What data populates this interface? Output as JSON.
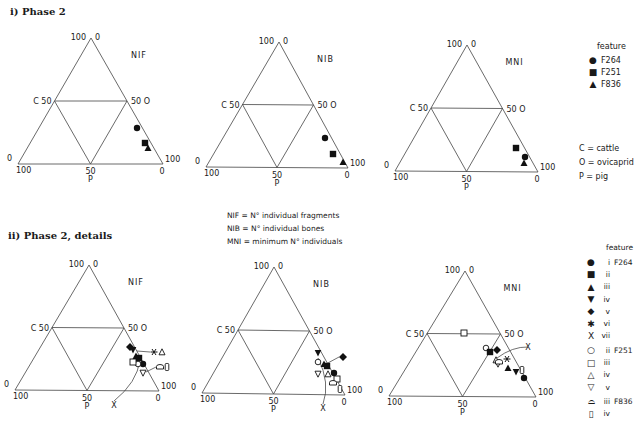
{
  "headings": {
    "phase2": "i) Phase  2",
    "phase2_details": "ii) Phase  2,  details"
  },
  "definitions": [
    "NIF  =  N° individual fragments",
    "NIB  =  N° individual bones",
    "MNI  =  minimum N° individuals"
  ],
  "abbreviations": [
    "C = cattle",
    "O = ovicaprid",
    "P = pig"
  ],
  "legend_phase2": {
    "title": "feature",
    "items": [
      {
        "symbol": "filled-circle",
        "label": "F264"
      },
      {
        "symbol": "filled-square",
        "label": "F251"
      },
      {
        "symbol": "filled-triangle",
        "label": "F836"
      }
    ]
  },
  "legend_details": {
    "title": "feature",
    "items": [
      {
        "symbol": "filled-circle",
        "code": "i",
        "feature": "F264"
      },
      {
        "symbol": "filled-square",
        "code": "ii",
        "feature": ""
      },
      {
        "symbol": "filled-triangle",
        "code": "iii",
        "feature": ""
      },
      {
        "symbol": "filled-inverted-triangle",
        "code": "iv",
        "feature": ""
      },
      {
        "symbol": "filled-diamond",
        "code": "v",
        "feature": ""
      },
      {
        "symbol": "asterisk",
        "code": "vi",
        "feature": ""
      },
      {
        "symbol": "x",
        "code": "vii",
        "feature": ""
      },
      {
        "symbol": "open-circle",
        "code": "ii",
        "feature": "F251"
      },
      {
        "symbol": "open-square",
        "code": "iii",
        "feature": ""
      },
      {
        "symbol": "open-triangle",
        "code": "iv",
        "feature": ""
      },
      {
        "symbol": "open-inverted-triangle",
        "code": "v",
        "feature": ""
      },
      {
        "symbol": "open-dome",
        "code": "iii",
        "feature": "F836"
      },
      {
        "symbol": "open-tall-rect",
        "code": "iv",
        "feature": ""
      }
    ]
  },
  "axis_labels": {
    "apex_left": "100",
    "apex_right": "0",
    "mid_left": "C 50",
    "mid_right": "50 O",
    "bl_top": "0",
    "bl_bottom": "100",
    "br_top": "100",
    "br_bottom": "0",
    "bottom_mid": "50",
    "bottom_axis": "P"
  },
  "chart_data": [
    {
      "type": "scatter",
      "subtype": "ternary",
      "title": "NIF",
      "panel": "i) Phase 2",
      "axes": {
        "C": "cattle",
        "O": "ovicaprid",
        "P": "pig"
      },
      "ticks": [
        0,
        50,
        100
      ],
      "geometry": {
        "apex": [
          91,
          38
        ],
        "left": [
          18,
          164
        ],
        "right": [
          163,
          164
        ]
      },
      "points": [
        {
          "feature": "F264",
          "symbol": "filled-circle",
          "x": 137,
          "y": 128
        },
        {
          "feature": "F251",
          "symbol": "filled-square",
          "x": 145,
          "y": 143
        },
        {
          "feature": "F836",
          "symbol": "filled-triangle",
          "x": 148,
          "y": 148
        }
      ]
    },
    {
      "type": "scatter",
      "subtype": "ternary",
      "title": "NIB",
      "panel": "i) Phase 2",
      "axes": {
        "C": "cattle",
        "O": "ovicaprid",
        "P": "pig"
      },
      "ticks": [
        0,
        50,
        100
      ],
      "geometry": {
        "apex": [
          279,
          42
        ],
        "left": [
          206,
          167
        ],
        "right": [
          348,
          168
        ]
      },
      "points": [
        {
          "feature": "F264",
          "symbol": "filled-circle",
          "x": 325,
          "y": 138
        },
        {
          "feature": "F251",
          "symbol": "filled-square",
          "x": 333,
          "y": 154
        },
        {
          "feature": "F836",
          "symbol": "filled-triangle",
          "x": 343,
          "y": 162
        }
      ]
    },
    {
      "type": "scatter",
      "subtype": "ternary",
      "title": "MNI",
      "panel": "i) Phase 2",
      "axes": {
        "C": "cattle",
        "O": "ovicaprid",
        "P": "pig"
      },
      "ticks": [
        0,
        50,
        100
      ],
      "geometry": {
        "apex": [
          467,
          45
        ],
        "left": [
          395,
          171
        ],
        "right": [
          538,
          172
        ]
      },
      "points": [
        {
          "feature": "F264",
          "symbol": "filled-circle",
          "x": 525,
          "y": 157
        },
        {
          "feature": "F251",
          "symbol": "filled-square",
          "x": 516,
          "y": 148
        },
        {
          "feature": "F836",
          "symbol": "filled-triangle",
          "x": 524,
          "y": 163
        }
      ]
    },
    {
      "type": "scatter",
      "subtype": "ternary",
      "title": "NIF",
      "panel": "ii) Phase 2, details",
      "axes": {
        "C": "cattle",
        "O": "ovicaprid",
        "P": "pig"
      },
      "ticks": [
        0,
        50,
        100
      ],
      "geometry": {
        "apex": [
          89,
          265
        ],
        "left": [
          15,
          390
        ],
        "right": [
          159,
          391
        ]
      },
      "points": [
        {
          "feature": "F264 v",
          "symbol": "filled-diamond",
          "x": 130,
          "y": 347
        },
        {
          "feature": "F264 iv",
          "symbol": "filled-inverted-triangle",
          "x": 133,
          "y": 350
        },
        {
          "feature": "F264 ii",
          "symbol": "filled-square",
          "x": 139,
          "y": 358
        },
        {
          "feature": "F264 iii",
          "symbol": "filled-triangle",
          "x": 136,
          "y": 356
        },
        {
          "feature": "F264 i",
          "symbol": "filled-circle",
          "x": 143,
          "y": 364
        },
        {
          "feature": "F251 ii",
          "symbol": "open-circle",
          "x": 138,
          "y": 364
        },
        {
          "feature": "F251 iii",
          "symbol": "open-square",
          "x": 133,
          "y": 362
        },
        {
          "feature": "F251 v",
          "symbol": "open-inverted-triangle",
          "x": 143,
          "y": 373
        },
        {
          "feature": "F264 vi",
          "symbol": "asterisk",
          "x": 154,
          "y": 352,
          "leader_to": [
            137,
            351
          ]
        },
        {
          "feature": "F251 iv",
          "symbol": "open-triangle",
          "x": 162,
          "y": 352
        },
        {
          "feature": "F836 iii",
          "symbol": "open-dome",
          "x": 160,
          "y": 367,
          "leader_to": [
            146,
            372
          ]
        },
        {
          "feature": "F836 iv",
          "symbol": "open-tall-rect",
          "x": 167,
          "y": 367
        },
        {
          "feature": "F264 vii",
          "symbol": "x",
          "x": 114,
          "y": 405,
          "leader_to": [
            140,
            360
          ],
          "curved": true
        }
      ]
    },
    {
      "type": "scatter",
      "subtype": "ternary",
      "title": "NIB",
      "panel": "ii) Phase 2, details",
      "axes": {
        "C": "cattle",
        "O": "ovicaprid",
        "P": "pig"
      },
      "ticks": [
        0,
        50,
        100
      ],
      "geometry": {
        "apex": [
          274,
          267
        ],
        "left": [
          202,
          393
        ],
        "right": [
          345,
          395
        ]
      },
      "points": [
        {
          "feature": "F264 iv",
          "symbol": "filled-inverted-triangle",
          "x": 318,
          "y": 353
        },
        {
          "feature": "F251 ii",
          "symbol": "open-circle",
          "x": 318,
          "y": 362
        },
        {
          "feature": "F264 ii",
          "symbol": "filled-square",
          "x": 327,
          "y": 366
        },
        {
          "feature": "F264 iii",
          "symbol": "filled-triangle",
          "x": 324,
          "y": 364
        },
        {
          "feature": "F264 v",
          "symbol": "filled-diamond",
          "x": 343,
          "y": 357,
          "leader_to": [
            326,
            364
          ]
        },
        {
          "feature": "F264 i",
          "symbol": "filled-circle",
          "x": 334,
          "y": 373
        },
        {
          "feature": "F251 v",
          "symbol": "open-inverted-triangle",
          "x": 318,
          "y": 374
        },
        {
          "feature": "F251 iv",
          "symbol": "open-triangle",
          "x": 328,
          "y": 374
        },
        {
          "feature": "F251 iii",
          "symbol": "open-square",
          "x": 337,
          "y": 379
        },
        {
          "feature": "F836 iii",
          "symbol": "open-dome",
          "x": 333,
          "y": 383
        },
        {
          "feature": "F836 iv",
          "symbol": "open-tall-rect",
          "x": 340,
          "y": 389
        },
        {
          "feature": "F264 vii",
          "symbol": "x",
          "x": 323,
          "y": 408,
          "leader_to": [
            318,
            358
          ],
          "curved": true
        }
      ]
    },
    {
      "type": "scatter",
      "subtype": "ternary",
      "title": "MNI",
      "panel": "ii) Phase 2, details",
      "axes": {
        "C": "cattle",
        "O": "ovicaprid",
        "P": "pig"
      },
      "ticks": [
        0,
        50,
        100
      ],
      "geometry": {
        "apex": [
          465,
          271
        ],
        "left": [
          389,
          396
        ],
        "right": [
          536,
          397
        ]
      },
      "points": [
        {
          "feature": "F251 iii",
          "symbol": "open-square",
          "x": 464,
          "y": 333
        },
        {
          "feature": "F251 ii",
          "symbol": "open-circle",
          "x": 486,
          "y": 348
        },
        {
          "feature": "F264 ii",
          "symbol": "filled-square",
          "x": 490,
          "y": 352
        },
        {
          "feature": "F264 v",
          "symbol": "filled-diamond",
          "x": 497,
          "y": 350
        },
        {
          "feature": "F264 vii",
          "symbol": "x",
          "x": 528,
          "y": 347,
          "leader_to": [
            497,
            358
          ],
          "curved": true
        },
        {
          "feature": "F264 vi",
          "symbol": "asterisk",
          "x": 507,
          "y": 359
        },
        {
          "feature": "F251 iv",
          "symbol": "open-triangle",
          "x": 496,
          "y": 360
        },
        {
          "feature": "F251 v",
          "symbol": "open-inverted-triangle",
          "x": 498,
          "y": 364
        },
        {
          "feature": "F836 iii",
          "symbol": "open-dome",
          "x": 499,
          "y": 362
        },
        {
          "feature": "F264 iii",
          "symbol": "filled-triangle",
          "x": 508,
          "y": 368
        },
        {
          "feature": "F264 iv",
          "symbol": "filled-inverted-triangle",
          "x": 516,
          "y": 372
        },
        {
          "feature": "F836 iv",
          "symbol": "open-tall-rect",
          "x": 522,
          "y": 370
        },
        {
          "feature": "F264 i",
          "symbol": "filled-circle",
          "x": 524,
          "y": 378
        }
      ]
    }
  ]
}
